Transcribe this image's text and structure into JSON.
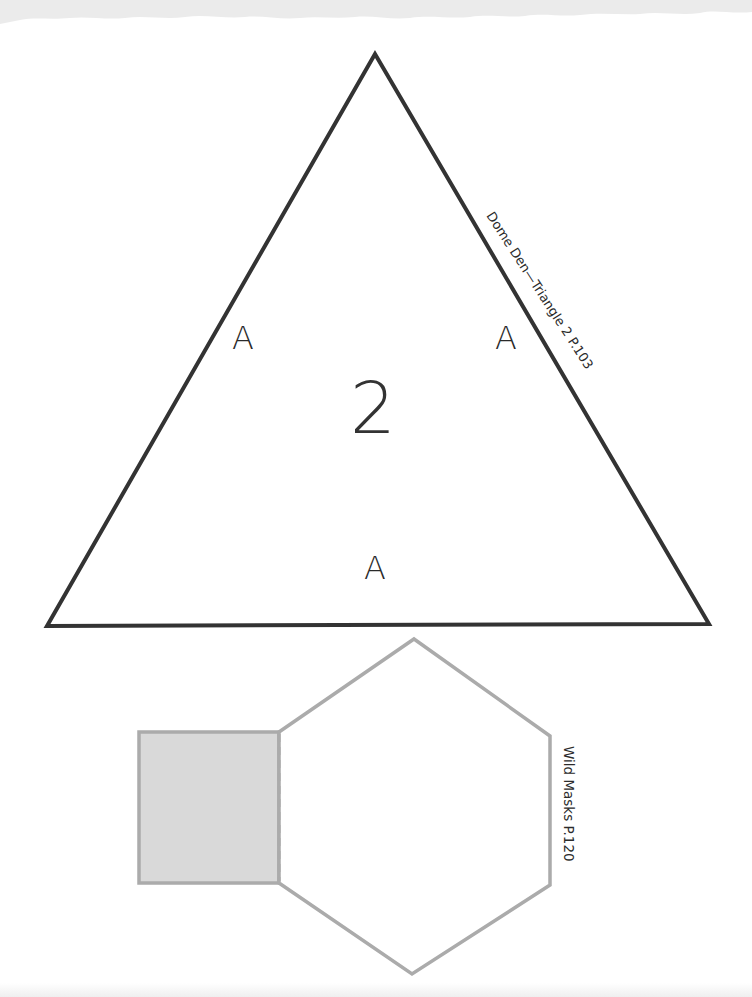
{
  "page": {
    "background": "#ffffff",
    "top_tear_color": "#ebebeb"
  },
  "triangle_template": {
    "number": "2",
    "edge_labels": [
      "A",
      "A",
      "A"
    ],
    "caption": "Dome Den—Triangle 2  P.103",
    "stroke_color": "#333333",
    "vertices": {
      "apex": [
        375,
        54
      ],
      "bottom_left": [
        47,
        626
      ],
      "bottom_right": [
        709,
        624
      ]
    }
  },
  "mask_template": {
    "caption": "Wild Masks  P.120",
    "stroke_color": "#ababab",
    "tab_fill": "#d9d9d9",
    "fold_line": "dashed"
  }
}
